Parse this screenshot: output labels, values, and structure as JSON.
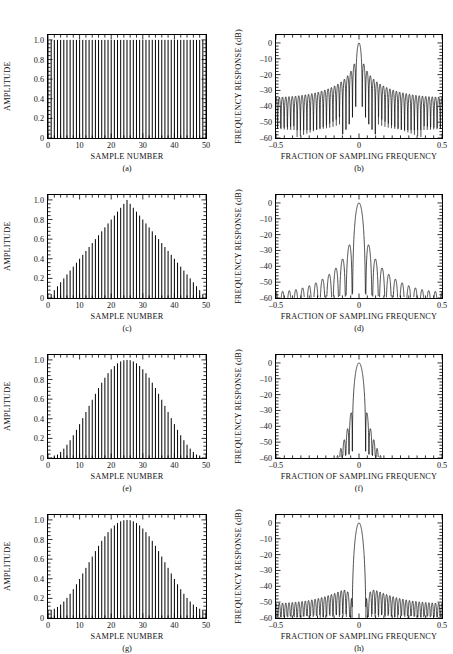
{
  "figure": {
    "width": 453,
    "height": 654,
    "background": "#ffffff",
    "ink": "#000000"
  },
  "axes": {
    "time": {
      "ylabel": "AMPLITUDE",
      "xlabel": "SAMPLE NUMBER",
      "yticks": [
        "0",
        "0.2",
        "0.4",
        "0.6",
        "0.8",
        "1.0"
      ],
      "ytick_values": [
        0,
        0.2,
        0.4,
        0.6,
        0.8,
        1.0
      ],
      "xticks": [
        "0",
        "10",
        "20",
        "30",
        "40",
        "50"
      ],
      "xtick_values": [
        0,
        10,
        20,
        30,
        40,
        50
      ],
      "ylim": [
        0,
        1.05
      ],
      "xlim": [
        0,
        50
      ],
      "minor_y_count": 4,
      "minor_x_count": 4,
      "grid": false
    },
    "freq": {
      "ylabel": "FREQUENCY RESPONSE (dB)",
      "xlabel": "FRACTION OF SAMPLING FREQUENCY",
      "yticks": [
        "0",
        "–10",
        "–20",
        "–30",
        "–40",
        "–50",
        "–60"
      ],
      "ytick_values": [
        0,
        -10,
        -20,
        -30,
        -40,
        -50,
        -60
      ],
      "xticks": [
        "–0.5",
        "0",
        "0.5"
      ],
      "xtick_values": [
        -0.5,
        0,
        0.5
      ],
      "ylim": [
        -60,
        5
      ],
      "xlim": [
        -0.5,
        0.5
      ],
      "minor_y_count": 4,
      "minor_x_count": 9,
      "grid": false
    }
  },
  "chart_data": [
    {
      "id": "a",
      "type": "bar",
      "caption": "(a)",
      "title": "",
      "window": "rectangular",
      "xlabel": "SAMPLE NUMBER",
      "ylabel": "AMPLITUDE",
      "xlim": [
        0,
        50
      ],
      "ylim": [
        0,
        1.05
      ],
      "npoints": 51,
      "note": "Rectangular window: all 51 samples equal 1.0",
      "values_formula": "w[n] = 1.0 for n = 0..50"
    },
    {
      "id": "b",
      "type": "line",
      "caption": "(b)",
      "window": "rectangular",
      "xlabel": "FRACTION OF SAMPLING FREQUENCY",
      "ylabel": "FREQUENCY RESPONSE (dB)",
      "xlim": [
        -0.5,
        0.5
      ],
      "ylim": [
        -60,
        5
      ],
      "peak_db": 0,
      "first_sidelobe_db": -13,
      "sidelobe_floor_db": -35,
      "mainlobe_half_width": 0.02,
      "note": "Dirichlet kernel; first sidelobe -13 dB, slow 6 dB/octave rolloff to about -35 dB at band edges"
    },
    {
      "id": "c",
      "type": "bar",
      "caption": "(c)",
      "window": "triangular",
      "xlabel": "SAMPLE NUMBER",
      "ylabel": "AMPLITUDE",
      "xlim": [
        0,
        50
      ],
      "ylim": [
        0,
        1.05
      ],
      "npoints": 51,
      "peak_sample": 25,
      "peak_value": 1.0,
      "endpoint_value": 0.0,
      "note": "Bartlett/triangular window rising linearly to 1.0 at sample 25"
    },
    {
      "id": "d",
      "type": "line",
      "caption": "(d)",
      "window": "triangular",
      "xlabel": "FRACTION OF SAMPLING FREQUENCY",
      "ylabel": "FREQUENCY RESPONSE (dB)",
      "xlim": [
        -0.5,
        0.5
      ],
      "ylim": [
        -60,
        5
      ],
      "peak_db": 0,
      "first_sidelobe_db": -27,
      "sidelobe_floor_db": -57,
      "mainlobe_half_width": 0.04,
      "note": "Squared Dirichlet kernel; first sidelobe -27 dB, 12 dB/octave rolloff"
    },
    {
      "id": "e",
      "type": "bar",
      "caption": "(e)",
      "window": "hanning",
      "xlabel": "SAMPLE NUMBER",
      "ylabel": "AMPLITUDE",
      "xlim": [
        0,
        50
      ],
      "ylim": [
        0,
        1.05
      ],
      "npoints": 51,
      "peak_sample": 25,
      "peak_value": 1.0,
      "endpoint_value": 0.0,
      "note": "Hanning (raised cosine) window, zero at both endpoints"
    },
    {
      "id": "f",
      "type": "line",
      "caption": "(f)",
      "window": "hanning",
      "xlabel": "FRACTION OF SAMPLING FREQUENCY",
      "ylabel": "FREQUENCY RESPONSE (dB)",
      "xlim": [
        -0.5,
        0.5
      ],
      "ylim": [
        -60,
        5
      ],
      "peak_db": 0,
      "first_sidelobe_db": -31,
      "sidelobe_floor_db": -60,
      "mainlobe_half_width": 0.04,
      "note": "First sidelobe -31 dB, very fast 18 dB/octave rolloff below -60 dB beyond 0.15"
    },
    {
      "id": "g",
      "type": "bar",
      "caption": "(g)",
      "window": "hamming",
      "xlabel": "SAMPLE NUMBER",
      "ylabel": "AMPLITUDE",
      "xlim": [
        0,
        50
      ],
      "ylim": [
        0,
        1.05
      ],
      "npoints": 51,
      "peak_sample": 25,
      "peak_value": 1.0,
      "endpoint_value": 0.08,
      "note": "Hamming window with non-zero endpoints of about 0.08"
    },
    {
      "id": "h",
      "type": "line",
      "caption": "(h)",
      "window": "hamming",
      "xlabel": "FRACTION OF SAMPLING FREQUENCY",
      "ylabel": "FREQUENCY RESPONSE (dB)",
      "xlim": [
        -0.5,
        0.5
      ],
      "ylim": [
        -60,
        5
      ],
      "peak_db": 0,
      "first_sidelobe_db": -43,
      "sidelobe_floor_db": -52,
      "mainlobe_half_width": 0.04,
      "note": "First sidelobe -43 dB, sidelobes flatten to about -50 dB across the band"
    }
  ],
  "rows": [
    {
      "left": "a",
      "right": "b"
    },
    {
      "left": "c",
      "right": "d"
    },
    {
      "left": "e",
      "right": "f"
    },
    {
      "left": "g",
      "right": "h"
    }
  ]
}
